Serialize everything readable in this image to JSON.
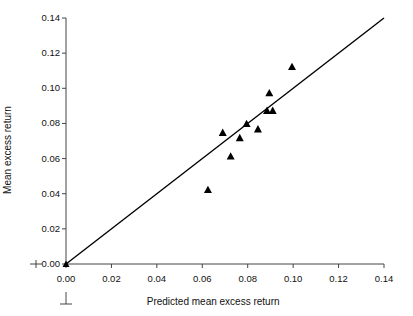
{
  "chart_data": {
    "type": "scatter",
    "title": "",
    "xlabel": "Predicted mean excess return",
    "ylabel": "Mean excess return",
    "xlim": [
      0.0,
      0.14
    ],
    "ylim": [
      0.0,
      0.14
    ],
    "xticks": [
      0.0,
      0.02,
      0.04,
      0.06,
      0.08,
      0.1,
      0.12,
      0.14
    ],
    "yticks": [
      0.0,
      0.02,
      0.04,
      0.06,
      0.08,
      0.1,
      0.12,
      0.14
    ],
    "xtick_labels": [
      "0.00",
      "0.02",
      "0.04",
      "0.06",
      "0.08",
      "0.10",
      "0.12",
      "0.14"
    ],
    "ytick_labels": [
      "0.00",
      "0.02",
      "0.04",
      "0.06",
      "0.08",
      "0.10",
      "0.12",
      "0.14"
    ],
    "grid": false,
    "legend": null,
    "marker": "triangle-up",
    "marker_color": "#000000",
    "marker_size": 8,
    "points": [
      {
        "x": 0.0625,
        "y": 0.0425
      },
      {
        "x": 0.069,
        "y": 0.075
      },
      {
        "x": 0.0725,
        "y": 0.0615
      },
      {
        "x": 0.0765,
        "y": 0.072
      },
      {
        "x": 0.0795,
        "y": 0.08
      },
      {
        "x": 0.0845,
        "y": 0.077
      },
      {
        "x": 0.0885,
        "y": 0.0875
      },
      {
        "x": 0.0895,
        "y": 0.0975
      },
      {
        "x": 0.091,
        "y": 0.0875
      },
      {
        "x": 0.0995,
        "y": 0.1125
      }
    ],
    "reference_line": {
      "name": "45-degree identity line",
      "from": {
        "x": 0.0,
        "y": 0.0
      },
      "to": {
        "x": 0.14,
        "y": 0.14
      },
      "color": "#000000",
      "width": 1.4
    },
    "axis_break_marks": {
      "y_axis": true,
      "x_axis": true
    }
  },
  "axes": {
    "x_title": "Predicted mean excess return",
    "y_title": "Mean excess return"
  }
}
